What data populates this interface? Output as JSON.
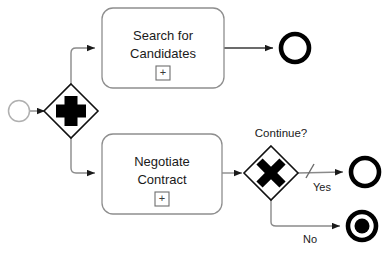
{
  "diagram": {
    "type": "bpmn-process-diagram",
    "colors": {
      "stroke_dark": "#000000",
      "stroke_light": "#9a9a9a",
      "stroke_mid": "#7a7a7a",
      "text": "#1a1a1a",
      "background": "#ffffff",
      "fill_shape": "#ffffff"
    },
    "nodes": [
      {
        "id": "start-event",
        "kind": "start-event",
        "shape": "circle-thin",
        "label": "",
        "cx": 19,
        "cy": 111,
        "r": 10.5
      },
      {
        "id": "parallel-gateway",
        "kind": "parallel-gateway",
        "shape": "diamond",
        "marker": "plus",
        "label": "",
        "cx": 71,
        "cy": 111,
        "half": 27
      },
      {
        "id": "task-search",
        "kind": "sub-process-task",
        "shape": "rounded-rect",
        "marker": "plus",
        "label_line1": "Search for",
        "label_line2": "Candidates",
        "x": 102,
        "y": 8,
        "w": 122,
        "h": 80
      },
      {
        "id": "task-negotiate",
        "kind": "sub-process-task",
        "shape": "rounded-rect",
        "marker": "plus",
        "label_line1": "Negotiate",
        "label_line2": "Contract",
        "x": 102,
        "y": 134,
        "w": 120,
        "h": 80
      },
      {
        "id": "exclusive-gateway",
        "kind": "exclusive-gateway",
        "shape": "diamond",
        "marker": "cross",
        "label": "Continue?",
        "cx": 271,
        "cy": 173,
        "half": 27
      },
      {
        "id": "end-event-top",
        "kind": "end-event",
        "shape": "circle-thick",
        "label": "",
        "cx": 295,
        "cy": 48,
        "r": 15
      },
      {
        "id": "end-event-yes",
        "kind": "end-event",
        "shape": "circle-thick",
        "label": "",
        "cx": 365,
        "cy": 172,
        "r": 15
      },
      {
        "id": "end-event-terminate",
        "kind": "terminate-end-event",
        "shape": "circle-thick-filled",
        "label": "",
        "cx": 362,
        "cy": 226,
        "r": 15
      }
    ],
    "flows": [
      {
        "id": "flow-start-to-gateway",
        "label": "",
        "from": "start-event",
        "to": "parallel-gateway",
        "default": false
      },
      {
        "id": "flow-gateway-to-search",
        "label": "",
        "from": "parallel-gateway",
        "to": "task-search",
        "default": false
      },
      {
        "id": "flow-gateway-to-negotiate",
        "label": "",
        "from": "parallel-gateway",
        "to": "task-negotiate",
        "default": false
      },
      {
        "id": "flow-search-to-end",
        "label": "",
        "from": "task-search",
        "to": "end-event-top",
        "default": false
      },
      {
        "id": "flow-negotiate-to-gateway",
        "label": "",
        "from": "task-negotiate",
        "to": "exclusive-gateway",
        "default": false
      },
      {
        "id": "flow-yes",
        "label": "Yes",
        "from": "exclusive-gateway",
        "to": "end-event-yes",
        "default": true
      },
      {
        "id": "flow-no",
        "label": "No",
        "from": "exclusive-gateway",
        "to": "end-event-terminate",
        "default": false
      }
    ],
    "markers": {
      "plus_glyph": "+",
      "cross_glyph": "✕"
    }
  }
}
